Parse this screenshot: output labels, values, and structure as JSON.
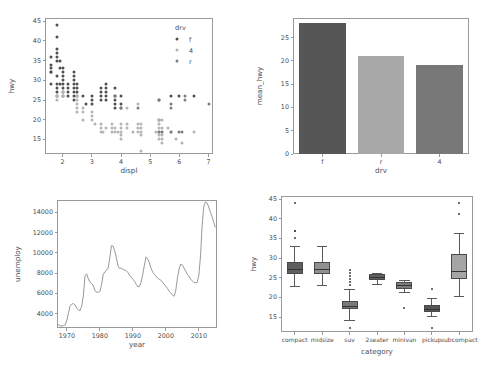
{
  "figure": {
    "width": 499,
    "height": 372,
    "background": "#ffffff",
    "panel_count": 4,
    "spine_color": "#9a9a9a",
    "tick_color": "#9a9a9a",
    "text_color": "#4d4d4d"
  },
  "chart_data": [
    {
      "id": "scatter-displ-hwy",
      "type": "scatter",
      "title": "",
      "xlabel": "displ",
      "ylabel": "hwy",
      "xlim": [
        1.4,
        7.15
      ],
      "ylim": [
        11.3,
        45.8
      ],
      "xticks": [
        2,
        3,
        4,
        5,
        6,
        7
      ],
      "yticks": [
        15,
        20,
        25,
        30,
        35,
        40,
        45
      ],
      "grid": false,
      "legend": {
        "title": "drv",
        "position": "upper right",
        "entries": [
          {
            "label": "f",
            "color": "#4f4f4f"
          },
          {
            "label": "4",
            "color": "#b4b4b4"
          },
          {
            "label": "r",
            "color": "#7d7d7d"
          }
        ]
      },
      "series": [
        {
          "name": "f",
          "color": "#4f4f4f",
          "points": [
            [
              1.6,
              33
            ],
            [
              1.6,
              32
            ],
            [
              1.6,
              29
            ],
            [
              1.6,
              32
            ],
            [
              1.6,
              34
            ],
            [
              1.6,
              36
            ],
            [
              1.8,
              44
            ],
            [
              1.8,
              41
            ],
            [
              1.8,
              38
            ],
            [
              1.8,
              37
            ],
            [
              1.8,
              36
            ],
            [
              1.8,
              35
            ],
            [
              1.8,
              31
            ],
            [
              1.8,
              29
            ],
            [
              1.8,
              28
            ],
            [
              1.8,
              26
            ],
            [
              1.8,
              27
            ],
            [
              1.9,
              33
            ],
            [
              1.9,
              35
            ],
            [
              1.9,
              29
            ],
            [
              2.0,
              31
            ],
            [
              2.0,
              30
            ],
            [
              2.0,
              29
            ],
            [
              2.0,
              28
            ],
            [
              2.0,
              27
            ],
            [
              2.0,
              26
            ],
            [
              2.0,
              33
            ],
            [
              2.0,
              32
            ],
            [
              2.2,
              26
            ],
            [
              2.2,
              27
            ],
            [
              2.2,
              28
            ],
            [
              2.2,
              29
            ],
            [
              2.4,
              31
            ],
            [
              2.4,
              30
            ],
            [
              2.4,
              29
            ],
            [
              2.4,
              28
            ],
            [
              2.4,
              27
            ],
            [
              2.4,
              26
            ],
            [
              2.4,
              25
            ],
            [
              2.4,
              32
            ],
            [
              2.5,
              27
            ],
            [
              2.5,
              28
            ],
            [
              2.5,
              26
            ],
            [
              2.5,
              29
            ],
            [
              2.7,
              26
            ],
            [
              2.8,
              24
            ],
            [
              3.0,
              26
            ],
            [
              3.0,
              25
            ],
            [
              3.0,
              24
            ],
            [
              3.3,
              28
            ],
            [
              3.3,
              27
            ],
            [
              3.3,
              26
            ],
            [
              3.3,
              25
            ],
            [
              3.5,
              29
            ],
            [
              3.5,
              28
            ],
            [
              3.5,
              27
            ],
            [
              3.5,
              26
            ],
            [
              3.5,
              25
            ],
            [
              3.8,
              28
            ],
            [
              3.8,
              26
            ],
            [
              3.8,
              25
            ],
            [
              3.8,
              24
            ],
            [
              3.8,
              23
            ],
            [
              4.0,
              26
            ],
            [
              4.0,
              24
            ],
            [
              4.0,
              23
            ],
            [
              5.3,
              25
            ],
            [
              5.3,
              20
            ],
            [
              5.7,
              26
            ],
            [
              6.0,
              26
            ],
            [
              6.5,
              26
            ]
          ]
        },
        {
          "name": "4",
          "color": "#b4b4b4",
          "points": [
            [
              1.8,
              26
            ],
            [
              1.8,
              25
            ],
            [
              2.0,
              26
            ],
            [
              2.0,
              27
            ],
            [
              2.5,
              26
            ],
            [
              2.5,
              25
            ],
            [
              2.5,
              24
            ],
            [
              2.5,
              23
            ],
            [
              2.5,
              22
            ],
            [
              2.7,
              20
            ],
            [
              2.7,
              22
            ],
            [
              2.7,
              23
            ],
            [
              3.0,
              22
            ],
            [
              3.0,
              21
            ],
            [
              3.0,
              20
            ],
            [
              3.1,
              19
            ],
            [
              3.3,
              19
            ],
            [
              3.3,
              18
            ],
            [
              3.3,
              17
            ],
            [
              3.4,
              17
            ],
            [
              3.5,
              18
            ],
            [
              3.7,
              19
            ],
            [
              3.7,
              18
            ],
            [
              3.7,
              17
            ],
            [
              3.8,
              18
            ],
            [
              3.8,
              17
            ],
            [
              3.9,
              17
            ],
            [
              4.0,
              19
            ],
            [
              4.0,
              18
            ],
            [
              4.0,
              17
            ],
            [
              4.0,
              16
            ],
            [
              4.0,
              15
            ],
            [
              4.2,
              23
            ],
            [
              4.2,
              19
            ],
            [
              4.2,
              18
            ],
            [
              4.4,
              17
            ],
            [
              4.6,
              24
            ],
            [
              4.6,
              19
            ],
            [
              4.6,
              18
            ],
            [
              4.6,
              17
            ],
            [
              4.7,
              19
            ],
            [
              4.7,
              18
            ],
            [
              4.7,
              17
            ],
            [
              4.7,
              16
            ],
            [
              4.7,
              12
            ],
            [
              5.2,
              17
            ],
            [
              5.3,
              20
            ],
            [
              5.3,
              19
            ],
            [
              5.3,
              18
            ],
            [
              5.3,
              17
            ],
            [
              5.3,
              16
            ],
            [
              5.3,
              15
            ],
            [
              5.4,
              20
            ],
            [
              5.4,
              18
            ],
            [
              5.4,
              17
            ],
            [
              5.4,
              16
            ],
            [
              5.4,
              15
            ],
            [
              5.4,
              14
            ],
            [
              5.6,
              18
            ],
            [
              5.7,
              17
            ],
            [
              5.9,
              15
            ],
            [
              6.1,
              14
            ],
            [
              6.5,
              17
            ]
          ]
        },
        {
          "name": "r",
          "color": "#7d7d7d",
          "points": [
            [
              3.8,
              26
            ],
            [
              4.0,
              23
            ],
            [
              4.6,
              23
            ],
            [
              5.3,
              25
            ],
            [
              5.7,
              23
            ],
            [
              5.7,
              24
            ],
            [
              6.2,
              26
            ],
            [
              6.2,
              25
            ],
            [
              7.0,
              24
            ],
            [
              5.7,
              17
            ],
            [
              6.0,
              17
            ],
            [
              6.1,
              17
            ],
            [
              5.4,
              17
            ],
            [
              5.3,
              17
            ]
          ]
        }
      ]
    },
    {
      "id": "bar-mean-hwy-by-drv",
      "type": "bar",
      "title": "",
      "xlabel": "drv",
      "ylabel": "mean_hwy",
      "categories": [
        "f",
        "r",
        "4"
      ],
      "values": [
        28.16,
        21.0,
        19.17
      ],
      "colors": [
        "#565656",
        "#a8a8a8",
        "#787878"
      ],
      "ylim": [
        0,
        29.2
      ],
      "yticks": [
        0,
        5,
        10,
        15,
        20,
        25
      ],
      "grid": false
    },
    {
      "id": "line-unemployment",
      "type": "line",
      "title": "",
      "xlabel": "year",
      "ylabel": "unemploy",
      "line_color": "#8c8c8c",
      "xlim": [
        1967,
        2015.5
      ],
      "ylim": [
        2600,
        15200
      ],
      "xticks": [
        1970,
        1980,
        1990,
        2000,
        2010
      ],
      "yticks": [
        4000,
        6000,
        8000,
        10000,
        12000,
        14000
      ],
      "grid": false,
      "x": [
        1967,
        1967.5,
        1968,
        1968.5,
        1969,
        1969.5,
        1970,
        1970.5,
        1971,
        1971.5,
        1972,
        1972.5,
        1973,
        1973.5,
        1974,
        1974.5,
        1975,
        1975.5,
        1976,
        1976.5,
        1977,
        1977.5,
        1978,
        1978.5,
        1979,
        1979.5,
        1980,
        1980.5,
        1981,
        1981.5,
        1982,
        1982.5,
        1983,
        1983.5,
        1984,
        1984.5,
        1985,
        1985.5,
        1986,
        1986.5,
        1987,
        1987.5,
        1988,
        1988.5,
        1989,
        1989.5,
        1990,
        1990.5,
        1991,
        1991.5,
        1992,
        1992.5,
        1993,
        1993.5,
        1994,
        1994.5,
        1995,
        1995.5,
        1996,
        1996.5,
        1997,
        1997.5,
        1998,
        1998.5,
        1999,
        1999.5,
        2000,
        2000.5,
        2001,
        2001.5,
        2002,
        2002.5,
        2003,
        2003.5,
        2004,
        2004.5,
        2005,
        2005.5,
        2006,
        2006.5,
        2007,
        2007.5,
        2008,
        2008.5,
        2009,
        2009.5,
        2010,
        2010.5,
        2011,
        2011.5,
        2012,
        2012.5,
        2013,
        2013.5,
        2014,
        2014.5,
        2015
      ],
      "y": [
        2944,
        2900,
        2820,
        2790,
        2830,
        2900,
        3380,
        4120,
        4810,
        4950,
        5010,
        4860,
        4540,
        4390,
        4300,
        4750,
        5800,
        7750,
        7930,
        7440,
        7100,
        6990,
        6750,
        6280,
        6130,
        6110,
        6200,
        6850,
        7870,
        8130,
        8270,
        8500,
        9480,
        10700,
        10650,
        10200,
        9500,
        8700,
        8450,
        8500,
        8400,
        8300,
        8230,
        8050,
        7800,
        7600,
        7400,
        7200,
        6900,
        6650,
        6700,
        7100,
        7900,
        8800,
        9600,
        9400,
        9000,
        8500,
        8100,
        7900,
        7700,
        7500,
        7400,
        7300,
        7100,
        6900,
        6700,
        6500,
        6200,
        6050,
        5850,
        5720,
        6300,
        7500,
        8400,
        8900,
        8800,
        8500,
        8200,
        7900,
        7700,
        7400,
        7250,
        7100,
        7050,
        7100,
        7800,
        9700,
        12700,
        14600,
        15000,
        14900,
        14500,
        14000,
        13600,
        13000,
        12500,
        12000,
        11500,
        11000,
        10400,
        9800,
        9200,
        8700
      ]
    },
    {
      "id": "box-hwy-by-category",
      "type": "box",
      "title": "",
      "xlabel": "category",
      "ylabel": "hwy",
      "ylim": [
        11.2,
        45.8
      ],
      "yticks": [
        15,
        20,
        25,
        30,
        35,
        40,
        45
      ],
      "grid": false,
      "categories": [
        "compact",
        "midsize",
        "suv",
        "2seater",
        "minivan",
        "pickup",
        "subcompact"
      ],
      "boxes": [
        {
          "label": "compact",
          "whisker_low": 22.8,
          "q1": 26.0,
          "median": 27.0,
          "q3": 29.0,
          "whisker_high": 33.0,
          "fliers": [
            44.0,
            37.0,
            36.8,
            35.0
          ],
          "color": "#5e5e5e"
        },
        {
          "label": "midsize",
          "whisker_low": 23.0,
          "q1": 26.0,
          "median": 27.0,
          "q3": 29.0,
          "whisker_high": 33.0,
          "fliers": [],
          "color": "#909090"
        },
        {
          "label": "suv",
          "whisker_low": 14.2,
          "q1": 17.0,
          "median": 17.6,
          "q3": 19.0,
          "whisker_high": 22.0,
          "fliers": [
            27.0,
            26.2,
            25.4,
            24.6,
            23.8,
            23.2,
            12.2
          ],
          "color": "#797979"
        },
        {
          "label": "2seater",
          "whisker_low": 23.2,
          "q1": 24.4,
          "median": 25.0,
          "q3": 26.0,
          "whisker_high": 26.2,
          "fliers": [],
          "color": "#606060"
        },
        {
          "label": "minivan",
          "whisker_low": 21.2,
          "q1": 22.2,
          "median": 23.0,
          "q3": 24.0,
          "whisker_high": 24.4,
          "fliers": [
            17.2
          ],
          "color": "#7c7c7c"
        },
        {
          "label": "pickup",
          "whisker_low": 15.2,
          "q1": 16.2,
          "median": 17.0,
          "q3": 18.0,
          "whisker_high": 19.8,
          "fliers": [
            22.1,
            12.2
          ],
          "color": "#555555"
        },
        {
          "label": "subcompact",
          "whisker_low": 20.3,
          "q1": 24.8,
          "median": 26.5,
          "q3": 31.0,
          "whisker_high": 36.3,
          "fliers": [
            44.0,
            41.3
          ],
          "color": "#a5a5a5"
        }
      ]
    }
  ]
}
